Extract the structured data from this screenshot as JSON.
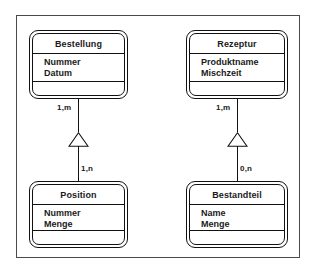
{
  "diagram": {
    "frame": {
      "name": "diagram-frame"
    },
    "classes": [
      {
        "id": "bestellung",
        "name": "Bestellung",
        "attributes": [
          "Nummer",
          "Datum"
        ],
        "operations": []
      },
      {
        "id": "rezeptur",
        "name": "Rezeptur",
        "attributes": [
          "Produktname",
          "Mischzeit"
        ],
        "operations": []
      },
      {
        "id": "position",
        "name": "Position",
        "attributes": [
          "Nummer",
          "Menge"
        ],
        "operations": []
      },
      {
        "id": "bestandteil",
        "name": "Bestandteil",
        "attributes": [
          "Name",
          "Menge"
        ],
        "operations": []
      }
    ],
    "relationships": [
      {
        "id": "bestellung-position",
        "type": "generalization",
        "from": "Bestellung",
        "to": "Position",
        "source_cardinality": "1,m",
        "target_cardinality": "1,n"
      },
      {
        "id": "rezeptur-bestandteil",
        "type": "generalization",
        "from": "Rezeptur",
        "to": "Bestandteil",
        "source_cardinality": "1,m",
        "target_cardinality": "0,n"
      }
    ],
    "colors": {
      "line": "#111111",
      "frame": "#4a4a4a",
      "text": "#1a1a1a",
      "background": "#ffffff"
    }
  }
}
